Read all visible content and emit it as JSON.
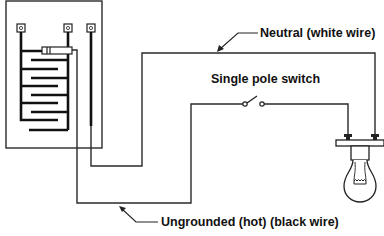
{
  "diagram": {
    "type": "wiring-diagram",
    "labels": {
      "neutral": "Neutral (white wire)",
      "switch": "Single pole switch",
      "hot": "Ungrounded (hot) (black wire)"
    },
    "components": [
      {
        "name": "heater-panel",
        "description": "Panel box with heating element and three terminals"
      },
      {
        "name": "single-pole-switch",
        "description": "Switch in hot wire path"
      },
      {
        "name": "light-fixture",
        "description": "Lamp holder with two terminals and incandescent bulb"
      }
    ],
    "wires": [
      {
        "name": "neutral-wire",
        "label_ref": "neutral",
        "from": "heater-panel",
        "to": "light-fixture"
      },
      {
        "name": "hot-wire",
        "label_ref": "hot",
        "from": "heater-panel",
        "to": "light-fixture",
        "via": "single-pole-switch"
      }
    ],
    "colors": {
      "line": "#2a2a2a",
      "background": "#ffffff"
    }
  }
}
